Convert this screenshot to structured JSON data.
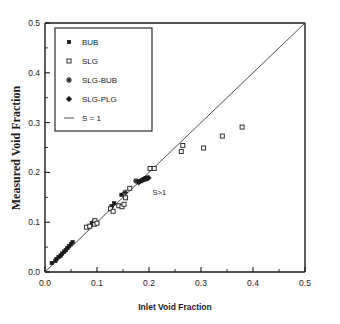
{
  "chart_data": {
    "type": "scatter",
    "title": "",
    "xlabel": "Inlet Void Fraction",
    "ylabel": "Measured Void Fraction",
    "xlim": [
      0.0,
      0.5
    ],
    "ylim": [
      0.0,
      0.5
    ],
    "grid": false,
    "legend_position": "top-left",
    "xticks": [
      "0.0",
      "0.1",
      "0.2",
      "0.3",
      "0.4",
      "0.5"
    ],
    "xtick_values": [
      0.0,
      0.1,
      0.2,
      0.3,
      0.4,
      0.5
    ],
    "yticks": [
      "0.0",
      "0.1",
      "0.2",
      "0.3",
      "0.4",
      "0.5"
    ],
    "ytick_values": [
      0.0,
      0.1,
      0.2,
      0.3,
      0.4,
      0.5
    ],
    "annotations": [
      {
        "text": "S<1",
        "x": 0.075,
        "y": 0.285
      },
      {
        "text": "S>1",
        "x": 0.22,
        "y": 0.155
      }
    ],
    "reference_line": {
      "name": "S = 1",
      "from": [
        0.0,
        0.0
      ],
      "to": [
        0.5,
        0.5
      ]
    },
    "series": [
      {
        "name": "BUB",
        "marker": "filled-square",
        "points": [
          [
            0.013,
            0.018
          ],
          [
            0.02,
            0.022
          ],
          [
            0.022,
            0.026
          ],
          [
            0.026,
            0.03
          ],
          [
            0.03,
            0.033
          ],
          [
            0.033,
            0.037
          ],
          [
            0.037,
            0.041
          ],
          [
            0.04,
            0.044
          ],
          [
            0.043,
            0.048
          ],
          [
            0.046,
            0.052
          ],
          [
            0.05,
            0.056
          ],
          [
            0.053,
            0.06
          ],
          [
            0.09,
            0.098
          ],
          [
            0.094,
            0.101
          ],
          [
            0.128,
            0.132
          ],
          [
            0.133,
            0.138
          ],
          [
            0.147,
            0.155
          ]
        ]
      },
      {
        "name": "SLG",
        "marker": "open-square",
        "points": [
          [
            0.08,
            0.09
          ],
          [
            0.086,
            0.092
          ],
          [
            0.095,
            0.096
          ],
          [
            0.096,
            0.103
          ],
          [
            0.1,
            0.098
          ],
          [
            0.126,
            0.127
          ],
          [
            0.131,
            0.122
          ],
          [
            0.142,
            0.133
          ],
          [
            0.148,
            0.131
          ],
          [
            0.152,
            0.136
          ],
          [
            0.163,
            0.168
          ],
          [
            0.155,
            0.149
          ],
          [
            0.202,
            0.208
          ],
          [
            0.21,
            0.208
          ],
          [
            0.262,
            0.242
          ],
          [
            0.265,
            0.254
          ],
          [
            0.305,
            0.249
          ],
          [
            0.341,
            0.273
          ],
          [
            0.379,
            0.291
          ]
        ]
      },
      {
        "name": "SLG-BUB",
        "marker": "plus",
        "points": [
          [
            0.154,
            0.16
          ],
          [
            0.175,
            0.183
          ],
          [
            0.19,
            0.186
          ],
          [
            0.194,
            0.188
          ]
        ]
      },
      {
        "name": "SLG-PLG",
        "marker": "filled-diamond",
        "points": [
          [
            0.18,
            0.18
          ],
          [
            0.184,
            0.183
          ],
          [
            0.187,
            0.184
          ],
          [
            0.192,
            0.187
          ],
          [
            0.196,
            0.188
          ],
          [
            0.199,
            0.189
          ]
        ]
      }
    ]
  },
  "legend": {
    "entries": [
      {
        "label": "BUB",
        "marker": "filled-square"
      },
      {
        "label": "SLG",
        "marker": "open-square"
      },
      {
        "label": "SLG-BUB",
        "marker": "plus"
      },
      {
        "label": "SLG-PLG",
        "marker": "filled-diamond"
      },
      {
        "label": "S = 1",
        "marker": "line"
      }
    ]
  }
}
